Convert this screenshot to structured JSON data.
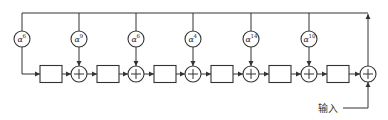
{
  "diagram": {
    "type": "LFSR / polynomial division circuit (feedback shift register)",
    "colors": {
      "line": "#333333",
      "background": "#ffffff"
    },
    "feedback_bus_y": 13,
    "coefficients": [
      {
        "symbol": "α",
        "exponent": "6",
        "x": 22
      },
      {
        "symbol": "α",
        "exponent": "9",
        "x": 79
      },
      {
        "symbol": "α",
        "exponent": "6",
        "x": 136
      },
      {
        "symbol": "α",
        "exponent": "4",
        "x": 193
      },
      {
        "symbol": "α",
        "exponent": "14",
        "x": 251
      },
      {
        "symbol": "α",
        "exponent": "10",
        "x": 309
      }
    ],
    "registers": [
      {
        "x": 40
      },
      {
        "x": 97
      },
      {
        "x": 154
      },
      {
        "x": 211
      },
      {
        "x": 269
      },
      {
        "x": 327
      }
    ],
    "adders": [
      {
        "x": 79
      },
      {
        "x": 136
      },
      {
        "x": 193
      },
      {
        "x": 251
      },
      {
        "x": 309
      },
      {
        "x": 368,
        "role": "output"
      }
    ],
    "input_label": "输入",
    "adder_symbol": "+"
  }
}
